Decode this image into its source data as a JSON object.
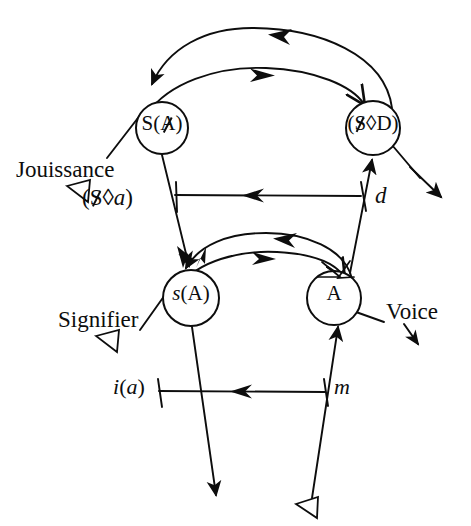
{
  "figure": {
    "type": "diagram",
    "background_color": "#ffffff",
    "stroke_color": "#0d0d0d",
    "width": 471,
    "height": 526
  },
  "nodes": [
    {
      "id": "s-barred-A",
      "label": "S(Ⱥ)",
      "label_prefix": "S(",
      "label_barred": "A",
      "label_suffix": ")",
      "cx": 162,
      "cy": 128,
      "r": 26
    },
    {
      "id": "barred-S-lozenge-D",
      "label": "($◊D)",
      "label_prefix": "(",
      "label_barred": "S",
      "label_mid": "◊",
      "label_suffix": "D)",
      "cx": 373,
      "cy": 128,
      "r": 27
    },
    {
      "id": "small-s-A",
      "label": "s(A)",
      "label_italic": "s",
      "label_suffix": "(A)",
      "cx": 191,
      "cy": 298,
      "r": 28
    },
    {
      "id": "big-A",
      "label": "A",
      "cx": 334,
      "cy": 298,
      "r": 27
    }
  ],
  "labels": {
    "jouissance": "Jouissance",
    "signifier": "Signifier",
    "voice": "Voice",
    "fantasy_formula": "($◊a)",
    "fantasy_prefix": "(",
    "fantasy_barred": "S",
    "fantasy_mid": "◊",
    "fantasy_suffix_italic": "a",
    "fantasy_close": ")",
    "demand": "d",
    "imaginary": "i(a)",
    "imaginary_italic_i": "i",
    "imaginary_paren_open": "(",
    "imaginary_italic_a": "a",
    "imaginary_paren_close": ")",
    "ego": "m"
  },
  "markers": {
    "hollow_triangle": "hollow-left-triangle",
    "filled_arrow": "filled-arrowhead",
    "open_arrow": "open-v-arrowhead"
  },
  "edges": [
    {
      "id": "upper-outer-arc",
      "from": "barred-S-lozenge-D",
      "to": "s-barred-A",
      "style": "arc",
      "direction": "right-to-left"
    },
    {
      "id": "upper-inner-arc",
      "from": "s-barred-A",
      "to": "barred-S-lozenge-D",
      "style": "arc",
      "direction": "left-to-right"
    },
    {
      "id": "demand-vector",
      "from": "barred-S-lozenge-D",
      "to": "fantasy",
      "style": "straight",
      "direction": "right-to-left",
      "label": "d"
    },
    {
      "id": "lower-outer-arc",
      "from": "big-A",
      "to": "small-s-A",
      "style": "arc",
      "direction": "right-to-left"
    },
    {
      "id": "lower-inner-arc",
      "from": "small-s-A",
      "to": "big-A",
      "style": "arc",
      "direction": "left-to-right"
    },
    {
      "id": "mirror-vector",
      "from": "big-A",
      "to": "small-s-A",
      "style": "straight",
      "direction": "right-to-left",
      "label": "m"
    },
    {
      "id": "signifier-chain-lower",
      "from": "bottom-hollow-triangle",
      "to": "big-A",
      "style": "straight",
      "direction": "upward"
    },
    {
      "id": "signifier-chain-upper",
      "from": "big-A",
      "to": "barred-S-lozenge-D",
      "style": "straight",
      "direction": "upward"
    },
    {
      "id": "jouissance-vector",
      "from": "s-barred-A",
      "to": "bottom-arrow",
      "style": "straight",
      "direction": "downward"
    },
    {
      "id": "voice-exit",
      "from": "barred-S-lozenge-D",
      "to": "voice-arrow",
      "style": "straight",
      "direction": "down-right"
    }
  ]
}
